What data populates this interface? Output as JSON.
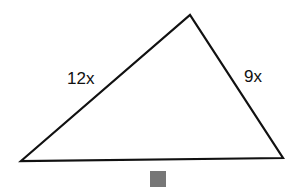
{
  "diagram": {
    "type": "triangle",
    "sides": {
      "left": "12x",
      "right": "9x",
      "bottom": ""
    },
    "bottom_marker_color": "#777777",
    "stroke_color": "#111111"
  }
}
